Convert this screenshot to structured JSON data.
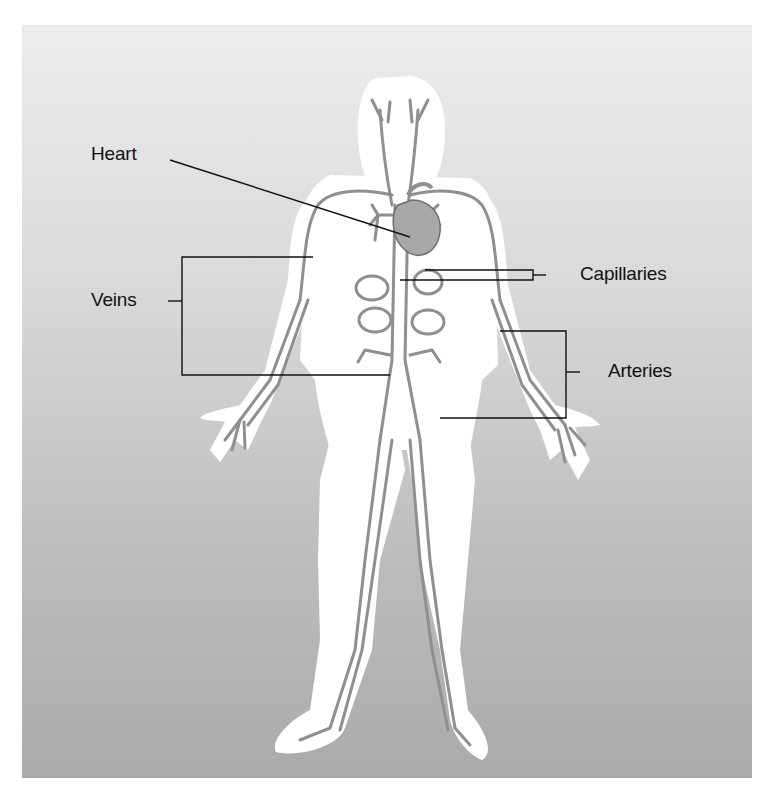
{
  "figure": {
    "colors": {
      "background_top": "#ececec",
      "background_bottom": "#aaaaaa",
      "body_halo": "#ffffff",
      "vessel": "#8f8f8f",
      "leader_line": "#111111"
    }
  },
  "labels": {
    "heart": "Heart",
    "veins": "Veins",
    "capillaries": "Capillaries",
    "arteries": "Arteries"
  }
}
